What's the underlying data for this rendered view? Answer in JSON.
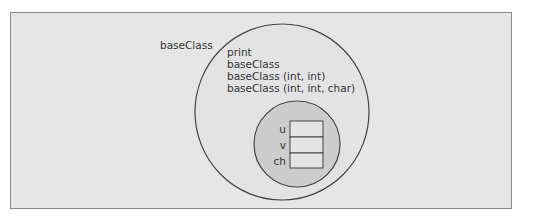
{
  "diagram": {
    "class_label": "baseClass",
    "methods": [
      "print",
      "baseClass",
      "baseClass (int, int)",
      "baseClass (int, int, char)"
    ],
    "fields": [
      "u",
      "v",
      "ch"
    ],
    "colors": {
      "background": "#e6e6e6",
      "outer_circle_fill": "#e3e3e3",
      "inner_circle_fill": "#cdcdcd",
      "cell_fill": "#e4e4e4",
      "stroke": "#444444",
      "frame_border": "#8a8a8a"
    }
  }
}
